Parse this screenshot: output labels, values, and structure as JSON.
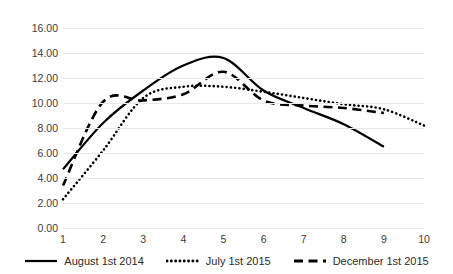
{
  "chart_data": {
    "type": "line",
    "title": "",
    "subtitle": "",
    "xlabel": "",
    "ylabel": "",
    "grid": true,
    "legend_position": "bottom",
    "x": [
      1,
      2,
      3,
      4,
      5,
      6,
      7,
      8,
      9,
      10
    ],
    "xlim": [
      1,
      10
    ],
    "ylim": [
      0,
      16
    ],
    "y_tick_labels": [
      "16.00",
      "14.00",
      "12.00",
      "10.00",
      "8.00",
      "6.00",
      "4.00",
      "2.00",
      "0.00"
    ],
    "y_tick_values": [
      16,
      14,
      12,
      10,
      8,
      6,
      4,
      2,
      0
    ],
    "x_tick_labels": [
      "1",
      "2",
      "3",
      "4",
      "5",
      "6",
      "7",
      "8",
      "9",
      "10"
    ],
    "series": [
      {
        "name": "August 1st 2014",
        "style": "solid",
        "color": "#000000",
        "x": [
          1,
          2,
          3,
          4,
          5,
          6,
          7,
          8,
          9
        ],
        "values": [
          4.7,
          8.4,
          11.0,
          13.0,
          13.6,
          11.0,
          9.6,
          8.3,
          6.5
        ]
      },
      {
        "name": "July 1st 2015",
        "style": "dotted",
        "color": "#000000",
        "x": [
          1,
          2,
          3,
          4,
          5,
          6,
          7,
          8,
          9,
          10
        ],
        "values": [
          2.3,
          6.2,
          10.4,
          11.3,
          11.3,
          10.9,
          10.4,
          9.9,
          9.5,
          8.2
        ]
      },
      {
        "name": "December 1st 2015",
        "style": "dashed",
        "color": "#000000",
        "x": [
          1,
          2,
          3,
          4,
          5,
          6,
          7,
          8,
          9
        ],
        "values": [
          3.4,
          10.1,
          10.2,
          10.7,
          12.5,
          10.2,
          9.8,
          9.6,
          9.2
        ]
      }
    ]
  },
  "legend": {
    "items": [
      {
        "label": "August 1st 2014",
        "style": "solid"
      },
      {
        "label": "July 1st 2015",
        "style": "dotted"
      },
      {
        "label": "December 1st 2015",
        "style": "dashed"
      }
    ]
  }
}
